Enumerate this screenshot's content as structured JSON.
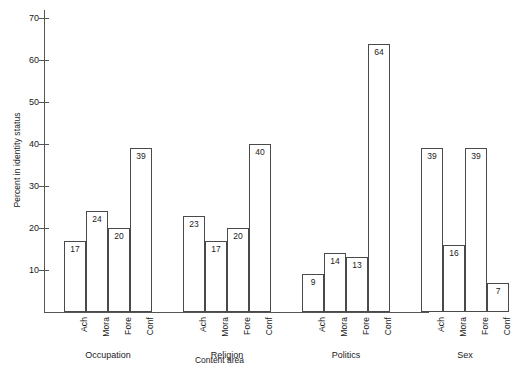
{
  "chart_data": {
    "type": "bar",
    "title": "",
    "xlabel": "Content area",
    "ylabel": "Percent in identity status",
    "ylim": [
      0,
      72
    ],
    "yticks": [
      10,
      20,
      30,
      40,
      50,
      60,
      70
    ],
    "grid": false,
    "legend": "none",
    "groups": [
      "Occupation",
      "Religion",
      "Politics",
      "Sex"
    ],
    "categories": [
      "Ach",
      "Mora",
      "Fore",
      "Conf"
    ],
    "series": [
      {
        "name": "Occupation",
        "values": [
          17,
          24,
          20,
          39
        ]
      },
      {
        "name": "Religion",
        "values": [
          23,
          17,
          20,
          40
        ]
      },
      {
        "name": "Politics",
        "values": [
          9,
          14,
          13,
          64
        ]
      },
      {
        "name": "Sex",
        "values": [
          39,
          16,
          39,
          7
        ]
      }
    ],
    "colors": {
      "bar_fill": "#ffffff",
      "bar_stroke": "#4a4a4a",
      "axis": "#555555",
      "text": "#1a1a1a",
      "background": "#ffffff"
    }
  }
}
